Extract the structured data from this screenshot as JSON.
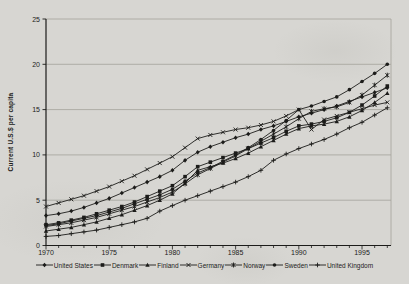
{
  "figure": {
    "background_color": "#d7d6d2",
    "ink_color": "#1c1c1a",
    "grid_color": "#a3a29b"
  },
  "chart_data": {
    "type": "line",
    "title": "",
    "xlabel": "",
    "ylabel": "Current U.S.$ per capita",
    "ylim": [
      0,
      25
    ],
    "xlim": [
      1970,
      1997
    ],
    "grid": "horizontal",
    "legend_position": "bottom",
    "x": [
      1970,
      1971,
      1972,
      1973,
      1974,
      1975,
      1976,
      1977,
      1978,
      1979,
      1980,
      1981,
      1982,
      1983,
      1984,
      1985,
      1986,
      1987,
      1988,
      1989,
      1990,
      1991,
      1992,
      1993,
      1994,
      1995,
      1996,
      1997
    ],
    "x_tick_labels": [
      1970,
      1975,
      1980,
      1985,
      1990,
      1995
    ],
    "y_ticks": [
      0,
      5,
      10,
      15,
      20,
      25
    ],
    "series": [
      {
        "name": "United States",
        "marker": "diamond",
        "values": [
          3.3,
          3.5,
          3.8,
          4.2,
          4.7,
          5.2,
          5.8,
          6.4,
          7.0,
          7.6,
          8.3,
          9.4,
          10.3,
          10.9,
          11.4,
          11.9,
          12.3,
          12.8,
          13.2,
          13.7,
          14.2,
          14.6,
          15.0,
          15.4,
          15.9,
          16.4,
          16.9,
          17.4
        ]
      },
      {
        "name": "Denmark",
        "marker": "square",
        "values": [
          2.3,
          2.5,
          2.8,
          3.1,
          3.5,
          3.9,
          4.3,
          4.8,
          5.4,
          6.0,
          6.6,
          7.6,
          8.7,
          9.2,
          9.7,
          10.2,
          10.7,
          11.3,
          11.9,
          12.6,
          13.2,
          13.4,
          13.7,
          14.1,
          14.7,
          15.5,
          16.5,
          17.6
        ]
      },
      {
        "name": "Finland",
        "marker": "triangle",
        "values": [
          1.6,
          1.8,
          2.0,
          2.3,
          2.6,
          3.0,
          3.4,
          3.9,
          4.4,
          5.0,
          5.7,
          6.9,
          8.3,
          8.7,
          9.1,
          9.6,
          10.2,
          10.9,
          11.6,
          12.3,
          12.9,
          13.2,
          13.4,
          13.7,
          14.2,
          14.9,
          15.8,
          16.8
        ]
      },
      {
        "name": "Germany",
        "marker": "x",
        "values": [
          4.3,
          4.7,
          5.1,
          5.5,
          6.0,
          6.5,
          7.1,
          7.7,
          8.4,
          9.1,
          9.8,
          10.8,
          11.8,
          12.2,
          12.5,
          12.8,
          13.0,
          13.3,
          13.7,
          14.3,
          15.0,
          12.8,
          13.9,
          14.3,
          14.7,
          15.1,
          15.5,
          15.8
        ]
      },
      {
        "name": "Norway",
        "marker": "asterisk",
        "values": [
          2.1,
          2.3,
          2.5,
          2.8,
          3.1,
          3.5,
          3.9,
          4.3,
          4.8,
          5.3,
          5.9,
          6.8,
          7.8,
          8.5,
          9.2,
          9.9,
          10.7,
          11.5,
          12.3,
          13.1,
          14.0,
          14.8,
          15.1,
          15.3,
          15.8,
          16.6,
          17.7,
          18.8
        ]
      },
      {
        "name": "Sweden",
        "marker": "circle",
        "values": [
          2.2,
          2.4,
          2.7,
          3.0,
          3.3,
          3.7,
          4.1,
          4.6,
          5.1,
          5.6,
          6.2,
          7.1,
          8.0,
          8.6,
          9.3,
          10.0,
          10.8,
          11.7,
          12.7,
          13.8,
          15.0,
          15.4,
          15.9,
          16.4,
          17.2,
          18.1,
          19.0,
          20.0
        ]
      },
      {
        "name": "United Kingdom",
        "marker": "plus",
        "values": [
          1.0,
          1.1,
          1.3,
          1.5,
          1.7,
          2.0,
          2.3,
          2.6,
          3.0,
          3.8,
          4.4,
          5.0,
          5.5,
          6.0,
          6.5,
          7.0,
          7.6,
          8.3,
          9.4,
          10.1,
          10.7,
          11.2,
          11.7,
          12.3,
          13.0,
          13.6,
          14.4,
          15.2
        ]
      }
    ]
  }
}
